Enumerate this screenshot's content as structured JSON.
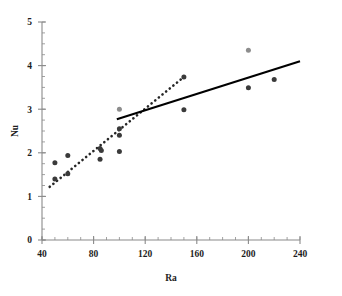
{
  "chart_data": {
    "type": "scatter",
    "title": "",
    "xlabel": "Ra",
    "ylabel": "Nu",
    "xlim": [
      40,
      240
    ],
    "ylim": [
      0,
      5
    ],
    "xticks": [
      40,
      80,
      120,
      160,
      200,
      240
    ],
    "yticks": [
      0,
      1,
      2,
      3,
      4,
      5
    ],
    "xtick_labels": [
      "40",
      "80",
      "120",
      "160",
      "200",
      "240"
    ],
    "ytick_labels": [
      "0",
      "1",
      "2",
      "3",
      "4",
      "5"
    ],
    "x_minor_tick_step": 10,
    "y_minor_tick_step": 0.25,
    "grid": false,
    "legend": "none",
    "marker": "filled-circle",
    "series": [
      {
        "name": "data-points-dark",
        "color": "#3a3a3a",
        "points": [
          {
            "x": 50,
            "y": 1.77
          },
          {
            "x": 50,
            "y": 1.4
          },
          {
            "x": 60,
            "y": 1.94
          },
          {
            "x": 60,
            "y": 1.52
          },
          {
            "x": 85,
            "y": 2.1
          },
          {
            "x": 86,
            "y": 2.05
          },
          {
            "x": 85,
            "y": 1.85
          },
          {
            "x": 100,
            "y": 2.55
          },
          {
            "x": 100,
            "y": 2.4
          },
          {
            "x": 100,
            "y": 2.03
          },
          {
            "x": 150,
            "y": 3.74
          },
          {
            "x": 150,
            "y": 2.99
          },
          {
            "x": 200,
            "y": 3.49
          },
          {
            "x": 220,
            "y": 3.68
          }
        ]
      },
      {
        "name": "data-points-light",
        "color": "#8d8d8d",
        "points": [
          {
            "x": 100,
            "y": 3.0
          },
          {
            "x": 200,
            "y": 4.35
          }
        ]
      }
    ],
    "fit_lines": [
      {
        "name": "dotted-trend-line",
        "style": "dotted",
        "color": "#262626",
        "x_start": 46,
        "y_start": 1.22,
        "x_end": 150,
        "y_end": 3.74
      },
      {
        "name": "solid-trend-line",
        "style": "solid",
        "color": "#000000",
        "x_start": 98,
        "y_start": 2.77,
        "x_end": 240,
        "y_end": 4.1
      }
    ]
  },
  "axes": {
    "y_axis_title": "Nu",
    "x_axis_title": "Ra"
  },
  "colors": {
    "axis": "#8a8a8a",
    "text": "#1d1d1d",
    "marker_dark": "#3a3a3a",
    "marker_light": "#8d8d8d",
    "solid_line": "#000000",
    "dotted_line": "#262626",
    "background": "#ffffff"
  }
}
